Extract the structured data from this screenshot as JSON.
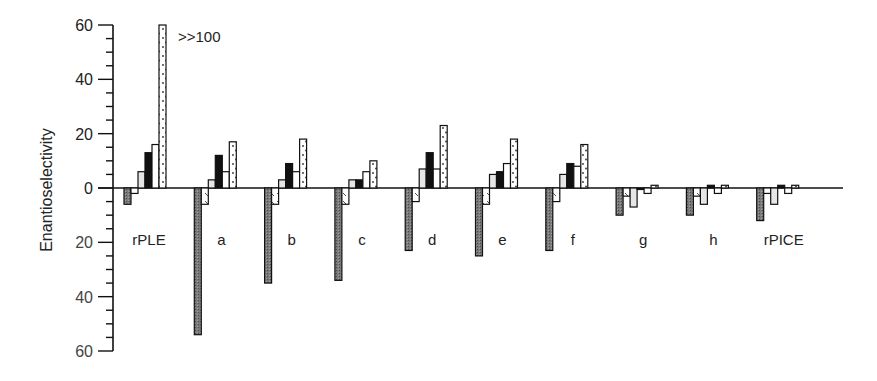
{
  "chart_data": {
    "type": "bar",
    "title": "",
    "xlabel": "",
    "ylabel": "Enantioselectivity",
    "ylim": [
      -60,
      60
    ],
    "y_ticks_major": [
      60,
      40,
      20,
      0,
      -20,
      -40,
      -60
    ],
    "y_tick_labels": [
      "60",
      "40",
      "20",
      "0",
      "20",
      "40",
      "60"
    ],
    "y_minor_step": 5,
    "grid": false,
    "legend": "none",
    "categories": [
      "rPLE",
      "a",
      "b",
      "c",
      "d",
      "e",
      "f",
      "g",
      "h",
      "rPICE"
    ],
    "series": [
      {
        "name": "series-1",
        "pattern": "gray-hatched",
        "values": [
          -6,
          -54,
          -35,
          -34,
          -23,
          -25,
          -23,
          -10,
          -10,
          -12
        ]
      },
      {
        "name": "series-2",
        "pattern": "white-striped",
        "values": [
          -2,
          -6,
          -6,
          -6,
          -5,
          -6,
          -5,
          -3,
          -3,
          -2
        ]
      },
      {
        "name": "series-3",
        "pattern": "light-gray",
        "values": [
          6,
          3,
          3,
          3,
          7,
          5,
          5,
          -7,
          -6,
          -6
        ]
      },
      {
        "name": "series-4",
        "pattern": "black",
        "values": [
          13,
          12,
          9,
          3,
          13,
          6,
          9,
          0,
          1,
          1
        ]
      },
      {
        "name": "series-5",
        "pattern": "white",
        "values": [
          16,
          6,
          6,
          6,
          7,
          9,
          8,
          -2,
          -2,
          -2
        ]
      },
      {
        "name": "series-6",
        "pattern": "dotted",
        "values": [
          100,
          17,
          18,
          10,
          23,
          18,
          16,
          1,
          1,
          1
        ]
      }
    ],
    "annotations": [
      {
        "text": ">>100",
        "category": "rPLE",
        "series": "series-6"
      }
    ]
  }
}
